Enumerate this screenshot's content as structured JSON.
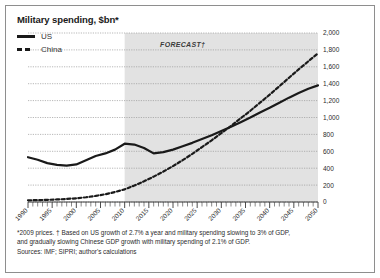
{
  "figure": {
    "title": "Military spending, $bn*",
    "forecast_label": "FORECAST†",
    "footnotes": [
      "*2009 prices. † Based on US growth of 2.7% a year and military spending slowing to 3% of GDP,",
      "and gradually slowing Chinese GDP growth with military spending of 2.1% of GDP.",
      "Sources: IMF; SIPRI; author's calculations"
    ]
  },
  "legend": {
    "position": "top-left",
    "items": [
      {
        "label": "US",
        "style": "solid",
        "color": "#1a1a1a"
      },
      {
        "label": "China",
        "style": "dotted",
        "color": "#1a1a1a"
      }
    ]
  },
  "chart_data": {
    "type": "line",
    "title": "Military spending, $bn*",
    "xlabel": "",
    "ylabel": "",
    "xlim": [
      1990,
      2050
    ],
    "ylim": [
      0,
      2000
    ],
    "ytick_step": 200,
    "xtick_step": 5,
    "minor_xtick_step": 1,
    "grid": "horizontal-dotted",
    "yticks": [
      0,
      200,
      400,
      600,
      800,
      1000,
      1200,
      1400,
      1600,
      1800,
      2000
    ],
    "ytick_labels": [
      "0",
      "200",
      "400",
      "600",
      "800",
      "1,000",
      "1,200",
      "1,400",
      "1,600",
      "1,800",
      "2,000"
    ],
    "xticks": [
      1990,
      1995,
      2000,
      2005,
      2010,
      2015,
      2020,
      2025,
      2030,
      2035,
      2040,
      2045,
      2050
    ],
    "xtick_labels": [
      "1990",
      "1995",
      "2000",
      "2005",
      "2010",
      "2015",
      "2020",
      "2025",
      "2030",
      "2035",
      "2040",
      "2045",
      "2050"
    ],
    "forecast_start": 2010,
    "forecast_shading": "#e2e2e2",
    "axis_side": "right",
    "series": [
      {
        "name": "US",
        "style": "solid",
        "color": "#1a1a1a",
        "x": [
          1990,
          1992,
          1994,
          1996,
          1998,
          2000,
          2002,
          2004,
          2006,
          2008,
          2010,
          2012,
          2014,
          2016,
          2018,
          2020,
          2022,
          2024,
          2026,
          2028,
          2030,
          2032,
          2034,
          2036,
          2038,
          2040,
          2042,
          2044,
          2046,
          2048,
          2050
        ],
        "values": [
          530,
          500,
          460,
          440,
          430,
          445,
          495,
          545,
          575,
          620,
          690,
          680,
          640,
          575,
          590,
          620,
          660,
          700,
          745,
          790,
          840,
          890,
          945,
          1000,
          1060,
          1115,
          1175,
          1235,
          1290,
          1340,
          1380
        ]
      },
      {
        "name": "China",
        "style": "dotted",
        "color": "#1a1a1a",
        "x": [
          1990,
          1992,
          1994,
          1996,
          1998,
          2000,
          2002,
          2004,
          2006,
          2008,
          2010,
          2012,
          2014,
          2016,
          2018,
          2020,
          2022,
          2024,
          2026,
          2028,
          2030,
          2032,
          2034,
          2036,
          2038,
          2040,
          2042,
          2044,
          2046,
          2048,
          2050
        ],
        "values": [
          20,
          22,
          25,
          30,
          36,
          44,
          56,
          72,
          92,
          118,
          150,
          195,
          245,
          300,
          360,
          425,
          495,
          570,
          650,
          730,
          815,
          900,
          990,
          1080,
          1175,
          1270,
          1370,
          1470,
          1570,
          1665,
          1760
        ]
      }
    ],
    "annotations": [
      {
        "text": "FORECAST†",
        "x": 2022,
        "y": 1830
      }
    ]
  }
}
